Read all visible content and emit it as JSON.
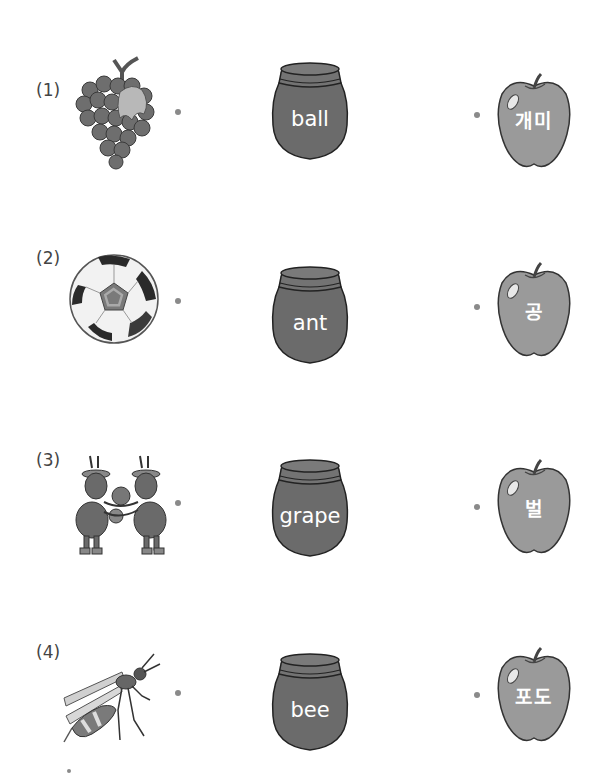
{
  "worksheet": {
    "instruction": "Match each picture to the English word and the Korean word",
    "rows": [
      {
        "number": "(1)",
        "picture": "grapes-picture",
        "word": "ball",
        "korean": "개미"
      },
      {
        "number": "(2)",
        "picture": "soccer-ball-picture",
        "word": "ant",
        "korean": "공"
      },
      {
        "number": "(3)",
        "picture": "ants-picture",
        "word": "grape",
        "korean": "벌"
      },
      {
        "number": "(4)",
        "picture": "bee-picture",
        "word": "bee",
        "korean": "포도"
      }
    ]
  },
  "colors": {
    "jar_fill": "#6b6b6b",
    "apple_fill": "#9a9a9a",
    "dot": "#8a8a8a",
    "text_on_shape": "#ffffff"
  }
}
